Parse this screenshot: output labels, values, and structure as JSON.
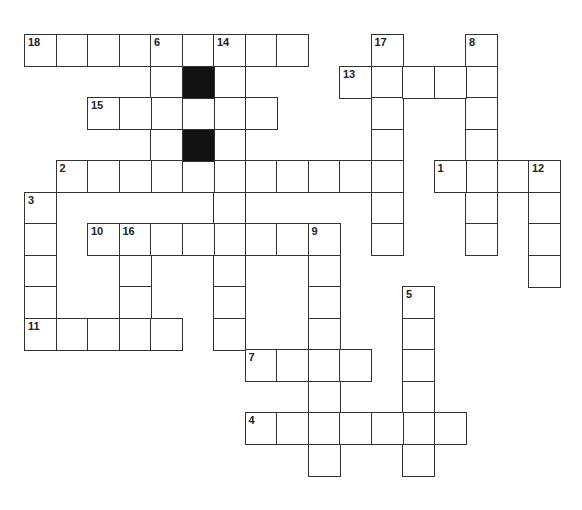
{
  "puzzle": {
    "type": "crossword",
    "cell_size": 31.5,
    "origin": {
      "x": 24,
      "y": 34
    },
    "colors": {
      "border": "#333333",
      "block": "#111111",
      "fill": "#ffffff"
    },
    "entries": [
      {
        "number": "18",
        "direction": "across",
        "row": 0,
        "col": 0,
        "length": 9
      },
      {
        "number": "6",
        "direction": "down",
        "row": 0,
        "col": 4,
        "length": 5
      },
      {
        "number": "14",
        "direction": "down",
        "row": 0,
        "col": 6,
        "length": 10
      },
      {
        "number": "17",
        "direction": "down",
        "row": 0,
        "col": 11,
        "length": 7
      },
      {
        "number": "8",
        "direction": "down",
        "row": 0,
        "col": 14,
        "length": 7
      },
      {
        "number": "13",
        "direction": "across",
        "row": 1,
        "col": 10,
        "length": 5
      },
      {
        "number": "15",
        "direction": "across",
        "row": 2,
        "col": 2,
        "length": 6
      },
      {
        "number": "2",
        "direction": "across",
        "row": 4,
        "col": 1,
        "length": 11
      },
      {
        "number": "1",
        "direction": "across",
        "row": 4,
        "col": 13,
        "length": 4
      },
      {
        "number": "12",
        "direction": "down",
        "row": 4,
        "col": 16,
        "length": 4
      },
      {
        "number": "3",
        "direction": "down",
        "row": 5,
        "col": 0,
        "length": 5
      },
      {
        "number": "10",
        "direction": "across",
        "row": 6,
        "col": 2,
        "length": 7
      },
      {
        "number": "16",
        "direction": "down",
        "row": 6,
        "col": 3,
        "length": 3
      },
      {
        "number": "9",
        "direction": "down",
        "row": 6,
        "col": 9,
        "length": 8
      },
      {
        "number": "11",
        "direction": "across",
        "row": 9,
        "col": 0,
        "length": 5
      },
      {
        "number": "5",
        "direction": "down",
        "row": 8,
        "col": 12,
        "length": 6
      },
      {
        "number": "7",
        "direction": "across",
        "row": 10,
        "col": 7,
        "length": 4
      },
      {
        "number": "4",
        "direction": "across",
        "row": 12,
        "col": 7,
        "length": 7
      }
    ],
    "blocks": [
      {
        "row": 1,
        "col": 5
      },
      {
        "row": 3,
        "col": 5
      }
    ],
    "extra_cells": [
      {
        "row": 2,
        "col": 5
      }
    ]
  }
}
